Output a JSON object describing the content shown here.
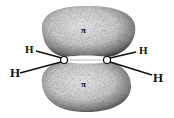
{
  "diagram": {
    "lobes": [
      {
        "position": "top",
        "label": "π"
      },
      {
        "position": "bottom",
        "label": "π"
      }
    ],
    "atoms": {
      "carbons": 2,
      "hydrogens": [
        {
          "label": "H",
          "position": "upper-left"
        },
        {
          "label": "H",
          "position": "lower-left"
        },
        {
          "label": "H",
          "position": "upper-right"
        },
        {
          "label": "H",
          "position": "lower-right"
        }
      ]
    },
    "colors": {
      "ink": "#111111",
      "background": "#ffffff",
      "shade": "#555555"
    }
  }
}
